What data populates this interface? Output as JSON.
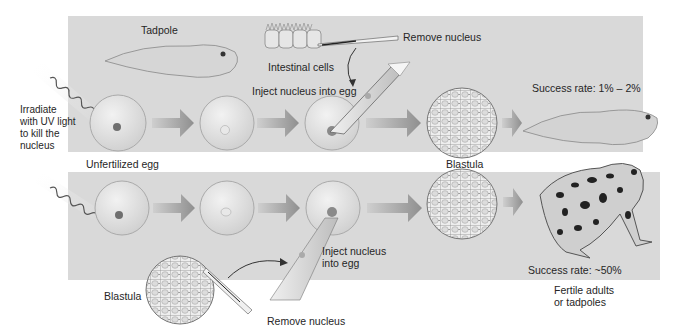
{
  "diagram": {
    "top_row": {
      "tadpole_label": "Tadpole",
      "donor_cells_label": "Intestinal cells",
      "remove_label": "Remove nucleus",
      "inject_label": "Inject nucleus into egg",
      "blastula_label": "Blastula",
      "success_label": "Success rate: 1% – 2%"
    },
    "left_side": {
      "irradiate_label": "Irradiate\nwith UV light\nto kill the\nnucleus",
      "egg_label": "Unfertilized egg"
    },
    "bottom_row": {
      "donor_label": "Blastula",
      "remove_label": "Remove nucleus",
      "inject_label": "Inject nucleus\ninto egg",
      "success_label": "Success rate: ~50%",
      "outcome_label": "Fertile adults\nor tadpoles"
    },
    "colors": {
      "panel": "#d9d9d9",
      "arrow": "#a8a8a8",
      "egg": "#e6e6e6",
      "text": "#262626"
    }
  }
}
